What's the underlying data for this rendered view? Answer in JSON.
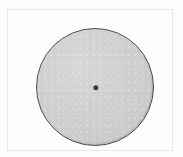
{
  "figure": {
    "kind": "geometric-diagram",
    "sheet": {
      "width_px": 183,
      "height_px": 157,
      "background_color": "#fdfdfd"
    },
    "frame": {
      "visible": true,
      "color": "#e9e9e9",
      "left_px": 6.5,
      "top_px": 8.5,
      "width_px": 166,
      "height_px": 142
    },
    "shapes": [
      {
        "name": "disc",
        "type": "circle",
        "center_x_px": 95,
        "center_y_px": 87,
        "diameter_px": 118,
        "radius_px": 59,
        "fill_color": "#cdcdcd",
        "stroke_color": "#4c4c4c",
        "stroke_width_px": 1.6
      },
      {
        "name": "center-point",
        "type": "dot",
        "center_x_px": 95,
        "center_y_px": 87,
        "diameter_px": 5.4,
        "fill_color": "#3a3a3a"
      }
    ],
    "labels": [],
    "annotations": []
  }
}
